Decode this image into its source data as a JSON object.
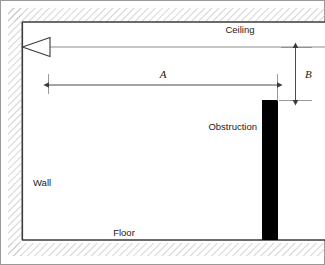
{
  "figure": {
    "type": "technical-diagram",
    "width": 325,
    "height": 265
  },
  "labels": {
    "ceiling": "Ceiling",
    "floor": "Floor",
    "wall": "Wall",
    "obstruction": "Obstruction"
  },
  "dimensions": {
    "horizontal": {
      "name": "A",
      "orientation": "horizontal",
      "from_x": 48,
      "to_x": 277,
      "y": 85
    },
    "vertical": {
      "name": "B",
      "orientation": "vertical",
      "x": 295,
      "from_y": 47,
      "to_y": 100
    }
  },
  "elements": {
    "source": {
      "name": "loudspeaker-source",
      "shape": "triangle",
      "apex_x": 22,
      "apex_y": 47,
      "base_x": 50,
      "top_y": 38,
      "bottom_y": 56
    },
    "ray": {
      "name": "sight-line",
      "y": 47,
      "from_x": 50,
      "to_x": 325
    },
    "obstruction_bar": {
      "x": 262,
      "y": 100,
      "width": 16,
      "height": 140
    },
    "room": {
      "left_wall_x": 22,
      "ceiling_y": 22,
      "floor_y": 240,
      "right_x": 325
    },
    "hatch_bands": {
      "top": {
        "x": 8,
        "y": 8,
        "width": 317,
        "height": 13
      },
      "left": {
        "x": 8,
        "y": 8,
        "width": 13,
        "height": 248
      },
      "bottom": {
        "x": 8,
        "y": 243,
        "width": 317,
        "height": 13
      }
    }
  },
  "colors": {
    "outline": "#3a3a3a",
    "hatch": "#b8b8b8",
    "obstruction_fill": "#000000",
    "ray_line": "#777777",
    "dimension_line": "#4a4a4a",
    "text": "#1a1a1a",
    "frame": "#9a9a9a",
    "background": "#ffffff"
  }
}
